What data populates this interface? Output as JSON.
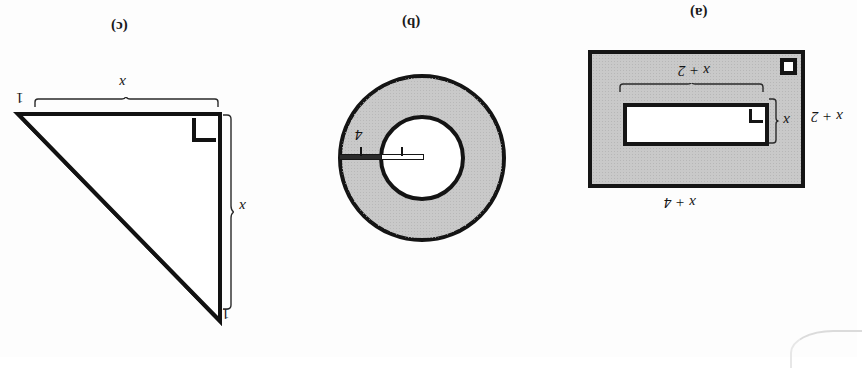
{
  "figure": {
    "caption_a": "(a)",
    "caption_b": "(b)",
    "caption_c": "(c)",
    "orientation": "rotated-180",
    "colors": {
      "shade_fill": "#c9c9c9",
      "stroke": "#151515",
      "white_fill": "#ffffff",
      "triangle_strip": "#4a4a4a"
    }
  },
  "part_a": {
    "label": "(a)",
    "shape": "nested-rectangles",
    "outer_width_label": "x + 4",
    "outer_height_label": "x + 2",
    "inner_width_label": "x + 2",
    "inner_height_label": "x",
    "outer_right_angle_marker": "right-angle",
    "inner_right_angle_marker": "right-angle"
  },
  "part_b": {
    "label": "(b)",
    "shape": "annulus",
    "inner_radius_label": "x",
    "ring_width_label": "4"
  },
  "part_c": {
    "label": "(c)",
    "shape": "right-triangle-with-strip",
    "leg_horizontal_label": "x",
    "leg_vertical_label": "x",
    "strip_width_label_top": "1",
    "strip_width_label_bottom": "1",
    "right_angle_marker": "right-angle"
  }
}
